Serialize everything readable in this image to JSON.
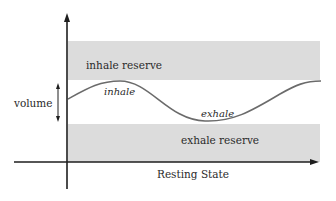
{
  "diagram": {
    "x_axis_label": "Resting State",
    "y_axis_label": "volume",
    "bands": [
      {
        "id": "inhale-reserve",
        "label": "inhale reserve",
        "color": "#dcdcdc"
      },
      {
        "id": "exhale-reserve",
        "label": "exhale reserve",
        "color": "#dcdcdc"
      }
    ],
    "curve": {
      "color": "#6b6b6b",
      "labels": {
        "inhale": "inhale",
        "exhale": "exhale"
      }
    },
    "colors": {
      "axis": "#1e1e1e",
      "band_fill": "#dcdcdc",
      "curve": "#6b6b6b",
      "text": "#2a2a2a",
      "background": "#ffffff"
    }
  }
}
